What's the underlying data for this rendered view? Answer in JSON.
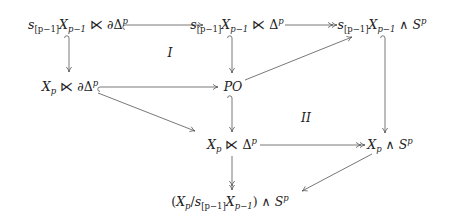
{
  "diagram": {
    "nodes": {
      "A": {
        "s": "s",
        "ssub": "[p−1]",
        "X": "X",
        "xsub": "p−1",
        "op": "⋉",
        "pre": "∂",
        "D": "Δ",
        "dsup": "p"
      },
      "B": {
        "s": "s",
        "ssub": "[p−1]",
        "X": "X",
        "xsub": "p−1",
        "op": "⋉",
        "D": "Δ",
        "dsup": "p"
      },
      "C": {
        "s": "s",
        "ssub": "[p−1]",
        "X": "X",
        "xsub": "p−1",
        "op": "∧",
        "S": "S",
        "ssup": "p"
      },
      "D": {
        "X": "X",
        "xsub": "p",
        "op": "⋉",
        "pre": "∂",
        "D": "Δ",
        "dsup": "p"
      },
      "E": {
        "text": "PO"
      },
      "F": {
        "X": "X",
        "xsub": "p",
        "op": "⋉",
        "D": "Δ",
        "dsup": "p"
      },
      "G": {
        "X": "X",
        "xsub": "p",
        "op": "∧",
        "S": "S",
        "ssup": "p"
      },
      "H": {
        "open": "(",
        "X": "X",
        "xsub": "p",
        "slash": "/",
        "s": "s",
        "ssub": "[p−1]",
        "X2": "X",
        "x2sub": "p−1",
        "close": ")",
        "op": "∧",
        "S": "S",
        "ssup": "p"
      }
    },
    "region_labels": {
      "I": "I",
      "II": "II"
    },
    "edges": [
      {
        "from": "A",
        "to": "B",
        "style": "hook"
      },
      {
        "from": "B",
        "to": "C",
        "style": "two-head"
      },
      {
        "from": "A",
        "to": "D",
        "style": "hook"
      },
      {
        "from": "B",
        "to": "E",
        "style": "hook"
      },
      {
        "from": "C",
        "to": "G",
        "style": "hook"
      },
      {
        "from": "D",
        "to": "E",
        "style": "hook"
      },
      {
        "from": "E",
        "to": "C",
        "style": "plain"
      },
      {
        "from": "D",
        "to": "F",
        "style": "plain"
      },
      {
        "from": "E",
        "to": "F",
        "style": "hook"
      },
      {
        "from": "F",
        "to": "G",
        "style": "two-head"
      },
      {
        "from": "F",
        "to": "H",
        "style": "two-head"
      },
      {
        "from": "G",
        "to": "H",
        "style": "plain"
      }
    ],
    "colors": {
      "ink": "#222222",
      "arrow": "#555555"
    }
  }
}
